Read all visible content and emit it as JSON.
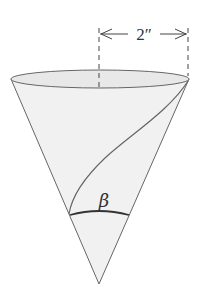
{
  "figure": {
    "type": "cone-diagram",
    "dimension_label": "2″",
    "angle_label": "β",
    "colors": {
      "stroke": "#555555",
      "fill": "#f1f1f1",
      "rim_fill": "#e6e6e6",
      "text": "#333333"
    }
  }
}
